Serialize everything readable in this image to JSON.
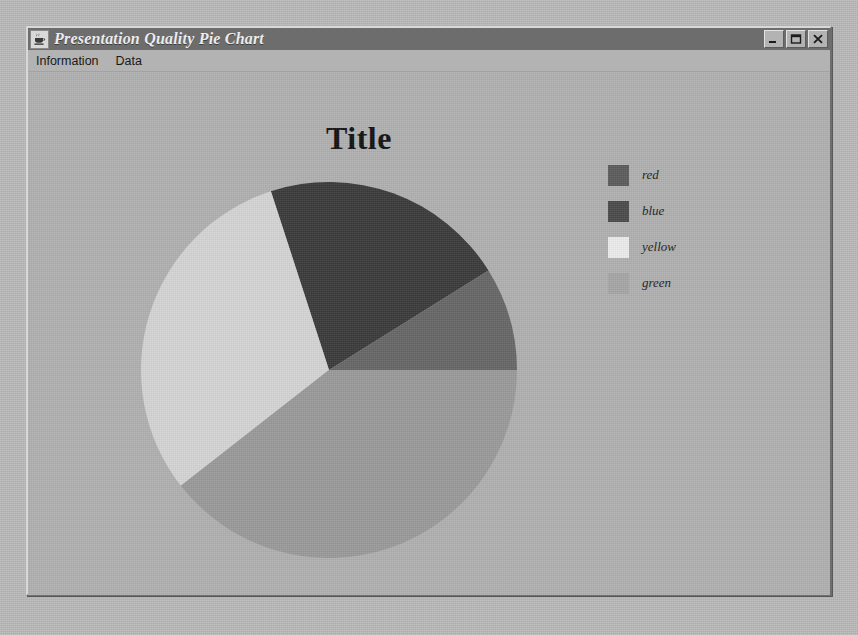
{
  "window": {
    "title": "Presentation Quality Pie Chart",
    "icon": "java-coffee-cup-icon",
    "controls": {
      "minimize": "Minimize",
      "maximize": "Maximize",
      "close": "Close"
    }
  },
  "menu": {
    "items": [
      {
        "label": "Information",
        "name": "menu-item-information"
      },
      {
        "label": "Data",
        "name": "menu-item-data"
      }
    ]
  },
  "chart_data": {
    "type": "pie",
    "title": "Title",
    "xlabel": "",
    "ylabel": "",
    "grid": false,
    "legend_position": "right",
    "categories": [
      "red",
      "blue",
      "yellow",
      "green"
    ],
    "values": [
      21,
      9,
      30,
      40
    ],
    "units": "percent",
    "start_angle_deg": 0,
    "direction": "counterclockwise",
    "slices": [
      {
        "label": "red",
        "value": 21,
        "sweep_deg": 76,
        "start_deg": 32,
        "end_deg": 108,
        "color": "#3a3a3a"
      },
      {
        "label": "blue",
        "value": 9,
        "sweep_deg": 32,
        "start_deg": 0,
        "end_deg": 32,
        "color": "#666666"
      },
      {
        "label": "yellow",
        "value": 30,
        "sweep_deg": 110,
        "start_deg": 108,
        "end_deg": 218,
        "color": "#d5d5d5"
      },
      {
        "label": "green",
        "value": 40,
        "sweep_deg": 142,
        "start_deg": 218,
        "end_deg": 360,
        "color": "#9a9a9a"
      }
    ],
    "legend": [
      {
        "label": "red",
        "color": "#5c5c5c"
      },
      {
        "label": "blue",
        "color": "#4a4a4a"
      },
      {
        "label": "yellow",
        "color": "#ececec"
      },
      {
        "label": "green",
        "color": "#a6a6a6"
      }
    ]
  },
  "colors": {
    "window_face": "#b3b3b3",
    "title_bar": "#6d6d6d",
    "title_text": "#ececec",
    "chart_bg": "#b0b0b0",
    "chart_title_text": "#111111"
  }
}
